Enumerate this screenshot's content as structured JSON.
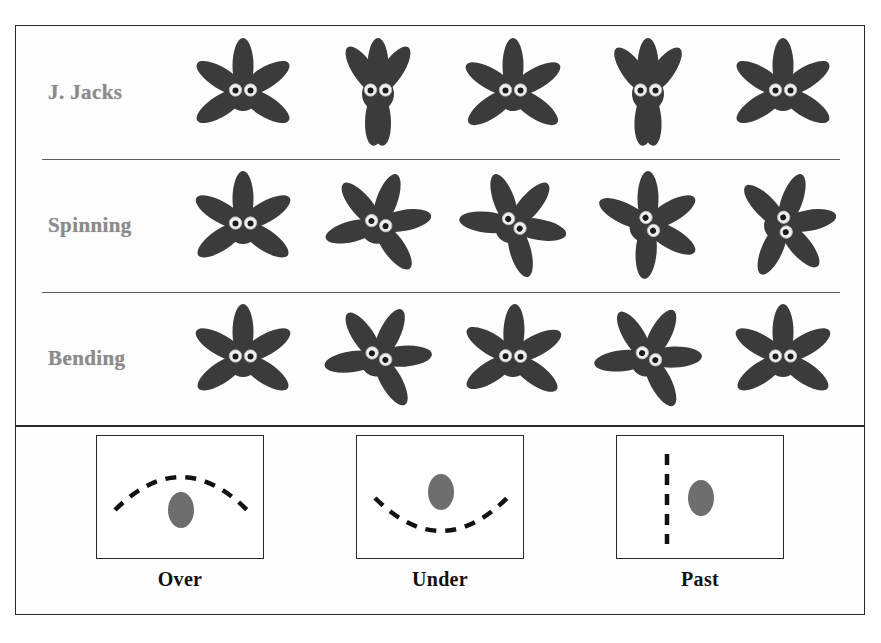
{
  "figure": {
    "background_color": "#fdfdfd",
    "frame_color": "#2a2a2a",
    "row_label_color": "#8b8b8b",
    "caption_color": "#111111",
    "creature_color": "#3b3b3b",
    "ball_color": "#6e6e6e",
    "dash_color": "#111111"
  },
  "rows": [
    {
      "label": "J. Jacks",
      "poses": [
        {
          "name": "arms-out-legs-out",
          "arms": [
            -148,
            -32,
            -90
          ],
          "legs": [
            -212,
            -328
          ]
        },
        {
          "name": "arms-up-legs-together",
          "arms": [
            -124,
            -56,
            -90
          ],
          "legs": [
            -265,
            -275
          ]
        },
        {
          "name": "arms-out-legs-out",
          "arms": [
            -150,
            -30,
            -90
          ],
          "legs": [
            -215,
            -325
          ]
        },
        {
          "name": "arms-up-legs-together",
          "arms": [
            -126,
            -54,
            -90
          ],
          "legs": [
            -264,
            -276
          ]
        },
        {
          "name": "arms-out-legs-out",
          "arms": [
            -148,
            -32,
            -90
          ],
          "legs": [
            -212,
            -328
          ]
        }
      ]
    },
    {
      "label": "Spinning",
      "poses": [
        {
          "name": "spin-0deg",
          "rotate": 0
        },
        {
          "name": "spin-20deg",
          "rotate": 20
        },
        {
          "name": "spin-40deg",
          "rotate": 40
        },
        {
          "name": "spin-60deg",
          "rotate": 60
        },
        {
          "name": "spin-80deg",
          "rotate": 80
        }
      ]
    },
    {
      "label": "Bending",
      "poses": [
        {
          "name": "bend-upright",
          "tilt": 0
        },
        {
          "name": "bend-right",
          "tilt": 26
        },
        {
          "name": "bend-upright",
          "tilt": 2
        },
        {
          "name": "bend-right",
          "tilt": 28
        },
        {
          "name": "bend-upright",
          "tilt": 0
        }
      ]
    }
  ],
  "legend": {
    "items": [
      {
        "caption": "Over",
        "path_name": "arc-over-ball",
        "path": "M 18 74 Q 84 8 150 74",
        "ball": {
          "cx": 84,
          "cy": 74,
          "r": 16
        }
      },
      {
        "caption": "Under",
        "path_name": "arc-under-ball",
        "path": "M 18 62 Q 84 128 150 62",
        "ball": {
          "cx": 84,
          "cy": 56,
          "r": 16
        }
      },
      {
        "caption": "Past",
        "path_name": "vertical-line-past-ball",
        "path": "M 50 18 L 50 108",
        "ball": {
          "cx": 84,
          "cy": 62,
          "r": 16
        }
      }
    ]
  }
}
